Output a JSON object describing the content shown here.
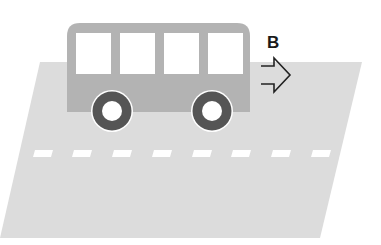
{
  "diagram": {
    "direction_label": "B",
    "arrow": "double-line-right-arrow",
    "colors": {
      "background": "#ffffff",
      "road": "#dcdcdc",
      "lane_marking": "#ffffff",
      "bus_body": "#b3b3b3",
      "bus_window": "#ffffff",
      "wheel_tire": "#555555",
      "wheel_hub": "#ffffff",
      "arrow": "#222222"
    },
    "bus": {
      "window_count": 4,
      "wheel_count": 2
    },
    "road": {
      "dash_count": 8
    }
  }
}
